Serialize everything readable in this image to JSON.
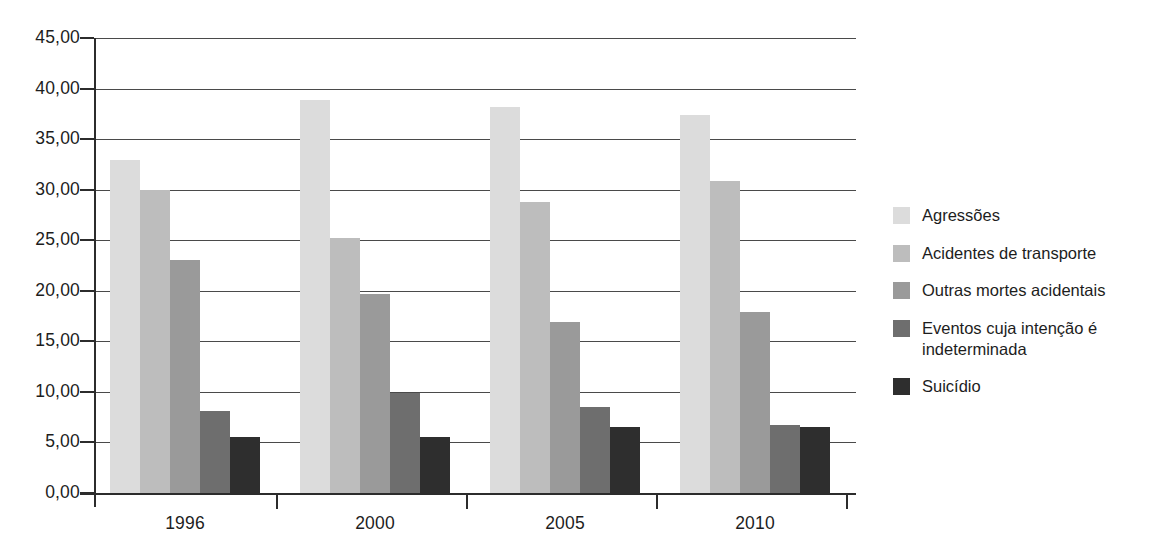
{
  "chart_data": {
    "type": "bar",
    "title": "",
    "subtitle": "",
    "xlabel": "",
    "ylabel": "",
    "categories": [
      "1996",
      "2000",
      "2005",
      "2010"
    ],
    "series": [
      {
        "name": "Agressões",
        "color": "#dcdcdc",
        "values": [
          32.9,
          38.9,
          38.2,
          37.4
        ]
      },
      {
        "name": "Acidentes de transporte",
        "color": "#bdbdbd",
        "values": [
          30.0,
          25.2,
          28.8,
          30.9
        ]
      },
      {
        "name": "Outras mortes acidentais",
        "color": "#9a9a9a",
        "values": [
          23.0,
          19.7,
          16.9,
          17.9
        ]
      },
      {
        "name": "Eventos cuja intenção é indeterminada",
        "color": "#6e6e6e",
        "values": [
          8.1,
          9.9,
          8.5,
          6.7
        ]
      },
      {
        "name": "Suicídio",
        "color": "#2e2e2e",
        "values": [
          5.5,
          5.5,
          6.5,
          6.5
        ]
      }
    ],
    "ylim": [
      0,
      45
    ],
    "ytick_step": 5,
    "ytick_labels": [
      "0,00",
      "5,00",
      "10,00",
      "15,00",
      "20,00",
      "25,00",
      "30,00",
      "35,00",
      "40,00",
      "45,00"
    ],
    "grid": true,
    "grid_axis": "y",
    "legend_position": "right",
    "annotations": []
  },
  "axes": {
    "y_tick_labels": [
      "45,00",
      "40,00",
      "35,00",
      "30,00",
      "25,00",
      "20,00",
      "15,00",
      "10,00",
      "5,00",
      "0,00"
    ],
    "x_tick_labels": [
      "1996",
      "2000",
      "2005",
      "2010"
    ]
  },
  "legend": {
    "items": [
      {
        "label": "Agressões",
        "color": "#dcdcdc"
      },
      {
        "label": "Acidentes de transporte",
        "color": "#bdbdbd"
      },
      {
        "label": "Outras mortes acidentais",
        "color": "#9a9a9a"
      },
      {
        "label": "Eventos cuja intenção é indeterminada",
        "color": "#6e6e6e"
      },
      {
        "label": "Suicídio",
        "color": "#2e2e2e"
      }
    ]
  },
  "colors": {
    "background": "#ffffff",
    "axis": "#2c2c2c",
    "gridline": "#4a4a4a",
    "text": "#1d1d1d"
  }
}
